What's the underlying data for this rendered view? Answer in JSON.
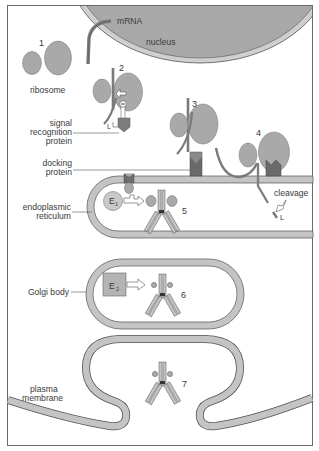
{
  "diagram": {
    "title": "",
    "colors": {
      "organelle_fill": "#a9a9a9",
      "membrane_fill": "#c4c4c4",
      "membrane_stroke": "#555555",
      "dark_protein": "#6e6e6e",
      "frame": "#6a6a6a",
      "text": "#3a3a3a",
      "background": "#ffffff"
    },
    "labels": {
      "mrna": "mRNA",
      "nucleus": "nucleus",
      "ribosome": "ribosome",
      "srp_line1": "signal",
      "srp_line2": "recognition",
      "srp_line3": "protein",
      "docking_line1": "docking",
      "docking_line2": "protein",
      "er_line1": "endoplasmic",
      "er_line2": "reticulum",
      "golgi": "Golgi body",
      "plasma_line1": "plasma",
      "plasma_line2": "membrane",
      "cleavage": "cleavage",
      "leader": "L",
      "leader_srp": "L",
      "enzyme1": "E",
      "enzyme1_sub": "1",
      "enzyme2": "E",
      "enzyme2_sub": "2"
    },
    "steps": [
      "1",
      "2",
      "3",
      "4",
      "5",
      "6",
      "7"
    ]
  }
}
